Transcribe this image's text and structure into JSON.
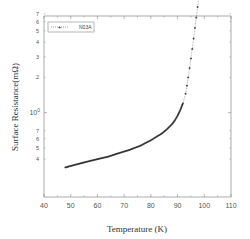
{
  "chart_data": {
    "type": "scatter",
    "title": "",
    "xlabel": "Temperature (K)",
    "ylabel": "Surface Resistance(mΩ)",
    "xlim": [
      40,
      110
    ],
    "ylim": [
      0.19,
      6.7
    ],
    "yscale": "log",
    "grid": false,
    "legend_position": "upper left",
    "x_ticks": [
      40,
      50,
      60,
      70,
      80,
      90,
      100,
      110
    ],
    "x_tick_labels": [
      "40",
      "50",
      "60",
      "70",
      "80",
      "90",
      "100",
      "110"
    ],
    "y_major_ticks": [
      1,
      10
    ],
    "y_major_labels": [
      "10⁰",
      "10¹"
    ],
    "y_minor_labels": [
      {
        "value": 60,
        "label": "6"
      },
      {
        "value": 50,
        "label": "5"
      },
      {
        "value": 40,
        "label": "4"
      },
      {
        "value": 30,
        "label": "3"
      },
      {
        "value": 20,
        "label": "2"
      },
      {
        "value": 7,
        "label": "7"
      },
      {
        "value": 6,
        "label": "6"
      },
      {
        "value": 5,
        "label": "5"
      },
      {
        "value": 4,
        "label": "4"
      },
      {
        "value": 3,
        "label": "3"
      },
      {
        "value": 2,
        "label": "2"
      },
      {
        "value": 0.7,
        "label": "7"
      },
      {
        "value": 0.6,
        "label": "6"
      },
      {
        "value": 0.5,
        "label": "5"
      },
      {
        "value": 0.4,
        "label": "4"
      }
    ],
    "series": [
      {
        "name": "N03A",
        "marker": "+",
        "line": "dotted",
        "color": "#222222",
        "x": [
          48,
          50,
          52,
          54,
          56,
          58,
          60,
          62,
          64,
          66,
          68,
          70,
          72,
          74,
          76,
          78,
          80,
          82,
          84,
          86,
          88,
          89,
          90,
          91,
          92,
          93,
          93.5,
          94,
          94.5,
          95,
          95.5,
          96,
          96.5,
          97,
          97.5,
          98,
          98.5,
          99,
          99.5,
          100,
          100.5,
          101,
          101.5,
          102,
          102.5,
          103
        ],
        "y": [
          0.34,
          0.35,
          0.36,
          0.37,
          0.38,
          0.39,
          0.4,
          0.41,
          0.42,
          0.435,
          0.45,
          0.465,
          0.48,
          0.5,
          0.52,
          0.55,
          0.58,
          0.62,
          0.66,
          0.72,
          0.8,
          0.86,
          0.94,
          1.05,
          1.2,
          1.45,
          1.7,
          2.0,
          2.4,
          2.9,
          3.5,
          4.3,
          5.3,
          6.5,
          8.0,
          10.0,
          12.5,
          15.5,
          19.0,
          23.5,
          28.5,
          34.0,
          40.0,
          46.0,
          52.0,
          58.0
        ]
      }
    ]
  },
  "legend": {
    "label": "N03A"
  }
}
